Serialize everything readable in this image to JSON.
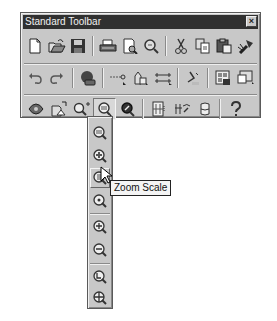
{
  "toolbar": {
    "title": "Standard Toolbar",
    "close_label": "×",
    "rows": [
      [
        {
          "name": "new-icon"
        },
        {
          "name": "open-icon"
        },
        {
          "name": "save-icon"
        },
        {
          "sep": true
        },
        {
          "name": "print-icon"
        },
        {
          "name": "print-preview-icon"
        },
        {
          "name": "find-icon"
        },
        {
          "sep": true
        },
        {
          "name": "cut-icon"
        },
        {
          "name": "copy-icon"
        },
        {
          "name": "paste-icon"
        },
        {
          "name": "match-properties-icon"
        }
      ],
      [
        {
          "name": "undo-icon"
        },
        {
          "name": "redo-icon"
        },
        {
          "sep": true
        },
        {
          "name": "web-icon"
        },
        {
          "sep": true
        },
        {
          "name": "tracking-icon"
        },
        {
          "name": "snap-icon"
        },
        {
          "name": "ucs-icon"
        },
        {
          "sep": true
        },
        {
          "name": "inquiry-icon"
        },
        {
          "sep": true
        },
        {
          "name": "properties-icon"
        },
        {
          "name": "design-center-icon"
        }
      ],
      [
        {
          "name": "pan-realtime-icon"
        },
        {
          "name": "zoom-realtime-icon"
        },
        {
          "name": "zoom-window-icon"
        },
        {
          "name": "zoom-flyout-icon",
          "pressed": true
        },
        {
          "name": "zoom-previous-icon"
        },
        {
          "sep": true
        },
        {
          "name": "aerial-view-icon"
        },
        {
          "name": "named-views-icon"
        },
        {
          "name": "3d-viewpoint-icon"
        },
        {
          "sep": true
        },
        {
          "name": "help-icon"
        }
      ]
    ]
  },
  "flyout": {
    "items": [
      {
        "name": "zoom-window-icon"
      },
      {
        "name": "zoom-dynamic-icon"
      },
      {
        "name": "zoom-scale-icon",
        "hover": true
      },
      {
        "name": "zoom-center-icon"
      },
      {
        "name": "zoom-in-icon"
      },
      {
        "name": "zoom-out-icon"
      },
      {
        "name": "zoom-all-icon"
      },
      {
        "name": "zoom-extents-icon"
      }
    ]
  },
  "tooltip": {
    "text": "Zoom Scale"
  }
}
